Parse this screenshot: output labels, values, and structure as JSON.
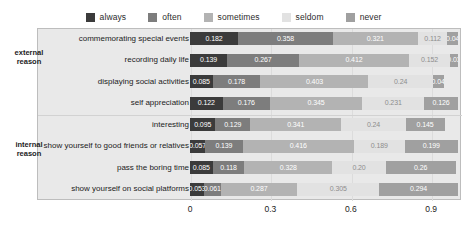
{
  "chart_data": {
    "type": "bar",
    "orientation": "horizontal",
    "stacked": true,
    "normalized": true,
    "title": "",
    "xlabel": "",
    "ylabel": "",
    "xlim": [
      0,
      1.0
    ],
    "xticks": [
      "0",
      "0.3",
      "0.6",
      "0.9"
    ],
    "xtick_values": [
      0,
      0.3,
      0.6,
      0.9
    ],
    "grid": true,
    "legend_position": "top",
    "legend": [
      "always",
      "often",
      "sometimes",
      "seldom",
      "never"
    ],
    "series_colors": [
      "#3b3b3b",
      "#7d7d7d",
      "#b3b3b3",
      "#e2e2e2",
      "#a0a0a0"
    ],
    "categories": [
      "commemorating special events",
      "recording daily life",
      "displaying social activities",
      "self appreciation",
      "interesting",
      "show yourself to good friends or relatives",
      "pass the boring time",
      "show yourself on social platforms"
    ],
    "group_labels": [
      "external\nreason",
      "internal\nreason"
    ],
    "groups": [
      {
        "label_line1": "external",
        "label_line2": "reason",
        "category_indices": [
          0,
          1,
          2,
          3
        ]
      },
      {
        "label_line1": "internal",
        "label_line2": "reason",
        "category_indices": [
          4,
          5,
          6,
          7
        ]
      }
    ],
    "series": [
      {
        "name": "always",
        "values": [
          0.182,
          0.139,
          0.085,
          0.122,
          0.095,
          0.057,
          0.085,
          0.053
        ]
      },
      {
        "name": "often",
        "values": [
          0.358,
          0.267,
          0.178,
          0.176,
          0.129,
          0.139,
          0.118,
          0.061
        ]
      },
      {
        "name": "sometimes",
        "values": [
          0.321,
          0.412,
          0.403,
          0.345,
          0.341,
          0.416,
          0.328,
          0.287
        ]
      },
      {
        "name": "seldom",
        "values": [
          0.112,
          0.152,
          0.24,
          0.231,
          0.24,
          0.189,
          0.2,
          0.305
        ]
      },
      {
        "name": "never",
        "values": [
          0.04,
          0.03,
          0.04,
          0.126,
          0.145,
          0.199,
          0.26,
          0.294
        ]
      }
    ],
    "value_labels": [
      [
        "0.182",
        "0.358",
        "0.321",
        "0.112",
        "0.04"
      ],
      [
        "0.139",
        "0.267",
        "0.412",
        "0.152",
        "0.03"
      ],
      [
        "0.085",
        "0.178",
        "0.403",
        "0.24",
        "0.04"
      ],
      [
        "0.122",
        "0.176",
        "0.345",
        "0.231",
        "0.126"
      ],
      [
        "0.095",
        "0.129",
        "0.341",
        "0.24",
        "0.145"
      ],
      [
        "0.057",
        "0.139",
        "0.416",
        "0.189",
        "0.199"
      ],
      [
        "0.085",
        "0.118",
        "0.328",
        "0.20",
        "0.26"
      ],
      [
        "0.053",
        "0.061",
        "0.287",
        "0.305",
        "0.294"
      ]
    ]
  },
  "style": {
    "plot_background": "#e9e9e9",
    "page_background": "#ffffff",
    "text_color": "#1c1c1c",
    "grid_color": "#dcdcdc"
  }
}
